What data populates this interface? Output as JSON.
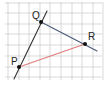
{
  "diagram": {
    "type": "geometry-grid",
    "grid": {
      "x_lines": [
        8,
        19,
        29,
        40,
        50,
        61,
        72,
        82,
        93,
        103
      ],
      "y_lines": [
        3,
        13,
        24,
        34,
        45,
        56,
        67,
        77
      ],
      "x_range": [
        5,
        102
      ],
      "y_range": [
        2,
        80
      ],
      "color": "#cfcfcf"
    },
    "points": [
      {
        "name": "Q",
        "x": 41,
        "y": 22,
        "label_x": 32,
        "label_y": 19
      },
      {
        "name": "R",
        "x": 85,
        "y": 44,
        "label_x": 88,
        "label_y": 40
      },
      {
        "name": "P",
        "x": 19,
        "y": 67,
        "label_x": 11,
        "label_y": 65
      }
    ],
    "lines": [
      {
        "name": "line-PQ",
        "x1": 14,
        "y1": 79,
        "x2": 47,
        "y2": 11,
        "color": "#333333"
      },
      {
        "name": "line-QR",
        "x1": 41,
        "y1": 22,
        "x2": 97,
        "y2": 51,
        "color": "#4a5878"
      },
      {
        "name": "segment-PR",
        "x1": 19,
        "y1": 67,
        "x2": 85,
        "y2": 44,
        "color": "#e07a7a"
      }
    ],
    "labels": {
      "P": "P",
      "Q": "Q",
      "R": "R"
    }
  }
}
